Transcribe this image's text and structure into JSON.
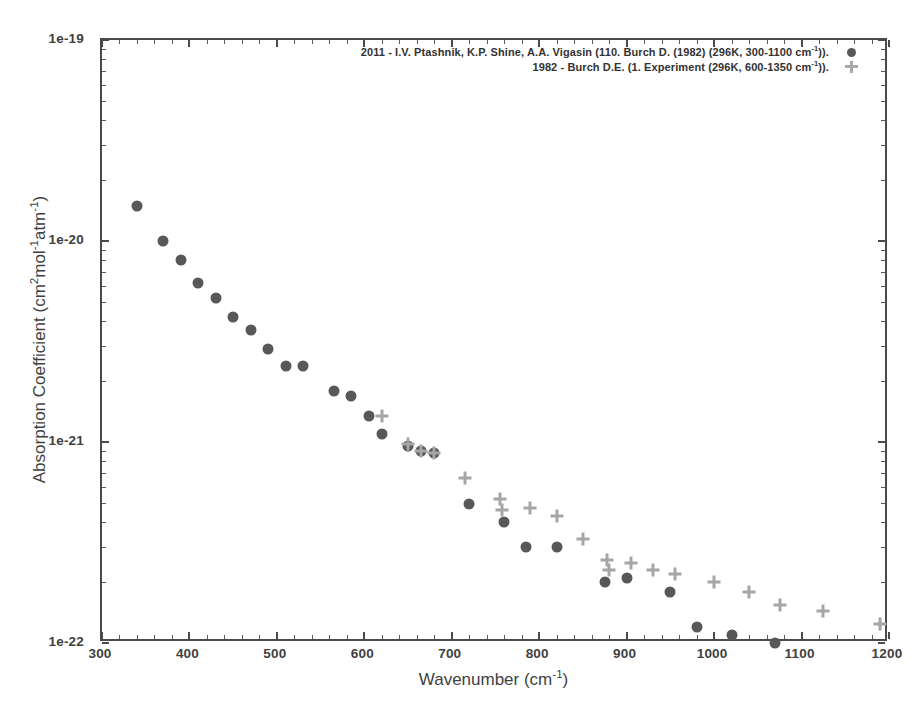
{
  "chart_data": {
    "type": "scatter",
    "title": "",
    "xlabel": "Wavenumber (cm-1)",
    "ylabel": "Absorption Coefficient (cm2mol-1atm-1)",
    "xlim": [
      300,
      1200
    ],
    "ylim": [
      1e-22,
      1e-19
    ],
    "yscale": "log",
    "xscale": "linear",
    "grid": false,
    "legend_position": "top-center",
    "xticks": [
      300,
      400,
      500,
      600,
      700,
      800,
      900,
      1000,
      1100,
      1200
    ],
    "xticklabels": [
      "300",
      "400",
      "500",
      "600",
      "700",
      "800",
      "900",
      "1000",
      "1100",
      "1200"
    ],
    "yticks": [
      1e-19,
      1e-20,
      1e-21,
      1e-22
    ],
    "yticklabels": [
      "1e-19",
      "1e-20",
      "1e-21",
      "1e-22"
    ],
    "series": [
      {
        "name": "2011 - I.V. Ptashnik, K.P. Shine, A.A. Vigasin (110. Burch D. (1982) (296K, 300-1100 cm-1)).",
        "marker": "circle",
        "color": "#585858",
        "x": [
          340,
          370,
          390,
          410,
          430,
          450,
          470,
          490,
          510,
          530,
          565,
          585,
          605,
          620,
          650,
          665,
          680,
          720,
          760,
          785,
          820,
          875,
          900,
          950,
          980,
          1020,
          1070
        ],
        "y": [
          1.5e-20,
          1e-20,
          8e-21,
          6.2e-21,
          5.2e-21,
          4.2e-21,
          3.6e-21,
          2.9e-21,
          2.4e-21,
          2.4e-21,
          1.8e-21,
          1.7e-21,
          1.35e-21,
          1.1e-21,
          9.5e-22,
          9e-22,
          8.8e-22,
          4.9e-22,
          4e-22,
          3e-22,
          3e-22,
          2e-22,
          2.1e-22,
          1.8e-22,
          1.2e-22,
          1.1e-22,
          1e-22
        ]
      },
      {
        "name": "1982 - Burch D.E. (1. Experiment (296K, 600-1350 cm-1)).",
        "marker": "plus",
        "color": "#a6a6a6",
        "x": [
          620,
          650,
          665,
          680,
          715,
          755,
          757,
          790,
          820,
          850,
          878,
          880,
          905,
          930,
          955,
          1000,
          1040,
          1075,
          1125,
          1190
        ],
        "y": [
          1.35e-21,
          9.8e-22,
          9e-22,
          8.8e-22,
          6.6e-22,
          5.2e-22,
          4.6e-22,
          4.7e-22,
          4.3e-22,
          3.3e-22,
          2.6e-22,
          2.3e-22,
          2.5e-22,
          2.3e-22,
          2.2e-22,
          2e-22,
          1.8e-22,
          1.55e-22,
          1.45e-22,
          1.25e-22
        ]
      }
    ]
  },
  "legend": {
    "entries": [
      {
        "label": "2011 - I.V. Ptashnik, K.P. Shine, A.A. Vigasin (110. Burch D. (1982) (296K, 300-1100 cm",
        "sup": "-1",
        "tail": "))."
      },
      {
        "label": "1982 - Burch D.E. (1. Experiment (296K, 600-1350 cm",
        "sup": "-1",
        "tail": "))."
      }
    ]
  },
  "axis": {
    "xlabel_main": "Wavenumber (cm",
    "xlabel_sup": "-1",
    "xlabel_tail": ")",
    "ylabel_p1": "Absorption Coefficient (cm",
    "ylabel_sup1": "2",
    "ylabel_p2": "mol",
    "ylabel_sup2": "-1",
    "ylabel_p3": "atm",
    "ylabel_sup3": "-1",
    "ylabel_p4": ")"
  },
  "colors": {
    "series1": "#585858",
    "series2": "#a6a6a6",
    "frame": "#4a4a4a",
    "text": "#3f3f3f",
    "background": "#ffffff"
  }
}
